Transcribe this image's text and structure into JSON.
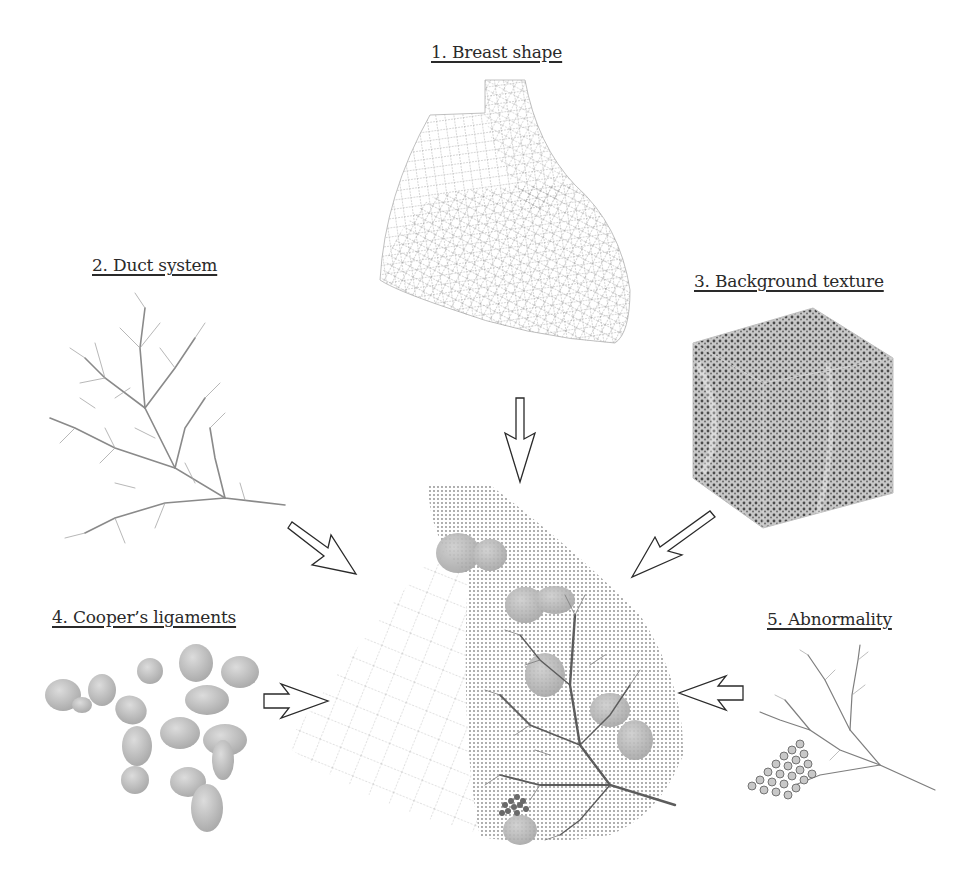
{
  "figure": {
    "components": [
      {
        "id": 1,
        "label": "1. Breast shape",
        "description": "wireframe mesh of breast surface"
      },
      {
        "id": 2,
        "label": "2. Duct system",
        "description": "branching ductal tree"
      },
      {
        "id": 3,
        "label": "3. Background texture",
        "description": "3D textured cube volume"
      },
      {
        "id": 4,
        "label": "4. Cooper’s ligaments",
        "description": "cluster of gray ellipsoid compartments"
      },
      {
        "id": 5,
        "label": "5. Abnormality",
        "description": "branching structure with calcification cluster"
      }
    ],
    "composite": {
      "description": "combined breast phantom: mesh + texture + ducts + ligaments + abnormality"
    },
    "arrows": [
      {
        "from": 1,
        "to": "composite",
        "direction": "down"
      },
      {
        "from": 2,
        "to": "composite",
        "direction": "down-right"
      },
      {
        "from": 3,
        "to": "composite",
        "direction": "down-left"
      },
      {
        "from": 4,
        "to": "composite",
        "direction": "right"
      },
      {
        "from": 5,
        "to": "composite",
        "direction": "left"
      }
    ],
    "colors": {
      "background": "#ffffff",
      "text": "#2a2a2a",
      "mesh": "#8a8a8a",
      "blob": "#c4c4c4",
      "tree": "#6e6e6e"
    }
  }
}
